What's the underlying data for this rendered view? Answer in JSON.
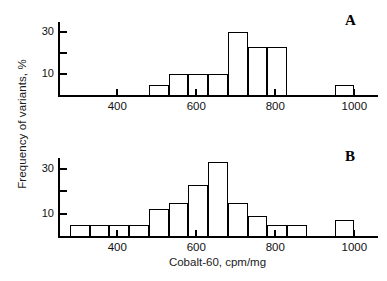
{
  "figure": {
    "xlabel": "Cobalt-60, cpm/mg",
    "ylabel": "Frequency of variants, %",
    "panel_a_tag": "A",
    "panel_b_tag": "B"
  },
  "axis": {
    "x_ticks": [
      400,
      600,
      800,
      1000
    ],
    "x_tick_labels": [
      "400",
      "600",
      "800",
      "1000"
    ],
    "y_ticks": [
      10,
      20,
      30
    ],
    "y_tick_labels": [
      "10",
      "",
      "30"
    ],
    "y_labeled": [
      "10",
      "30"
    ],
    "xlim": [
      250,
      1060
    ],
    "ylim": [
      0,
      35
    ]
  },
  "chart_data": [
    {
      "type": "bar",
      "title": "A",
      "xlabel": "Cobalt-60, cpm/mg",
      "ylabel": "Frequency of variants, %",
      "xlim": [
        250,
        1060
      ],
      "ylim": [
        0,
        35
      ],
      "grid": false,
      "legend": "none",
      "bin_width": 50,
      "bin_starts": [
        480,
        530,
        580,
        630,
        680,
        730,
        780,
        950
      ],
      "bin_ends": [
        530,
        580,
        630,
        680,
        730,
        780,
        830,
        1000
      ],
      "categories": [
        "480-530",
        "530-580",
        "580-630",
        "630-680",
        "680-730",
        "730-780",
        "780-830",
        "950-1000"
      ],
      "values": [
        5,
        10,
        10,
        10,
        30,
        23,
        23,
        5
      ],
      "xtick_values": [
        400,
        600,
        800,
        1000
      ],
      "ytick_values": [
        10,
        20,
        30
      ],
      "ytick_labels": [
        "10",
        "",
        "30"
      ]
    },
    {
      "type": "bar",
      "title": "B",
      "xlabel": "Cobalt-60, cpm/mg",
      "ylabel": "Frequency of variants, %",
      "xlim": [
        250,
        1060
      ],
      "ylim": [
        0,
        35
      ],
      "grid": false,
      "legend": "none",
      "bin_width": 50,
      "bin_starts": [
        280,
        330,
        380,
        430,
        480,
        530,
        580,
        630,
        680,
        730,
        780,
        830,
        950
      ],
      "bin_ends": [
        330,
        380,
        430,
        480,
        530,
        580,
        630,
        680,
        730,
        780,
        830,
        880,
        1000
      ],
      "categories": [
        "280-330",
        "330-380",
        "380-430",
        "430-480",
        "480-530",
        "530-580",
        "580-630",
        "630-680",
        "680-730",
        "730-780",
        "780-830",
        "830-880",
        "950-1000"
      ],
      "values": [
        5,
        5,
        5,
        5,
        12,
        15,
        23,
        33,
        15,
        9,
        5,
        5,
        7
      ],
      "xtick_values": [
        400,
        600,
        800,
        1000
      ],
      "ytick_values": [
        10,
        20,
        30
      ],
      "ytick_labels": [
        "10",
        "",
        "30"
      ]
    }
  ]
}
